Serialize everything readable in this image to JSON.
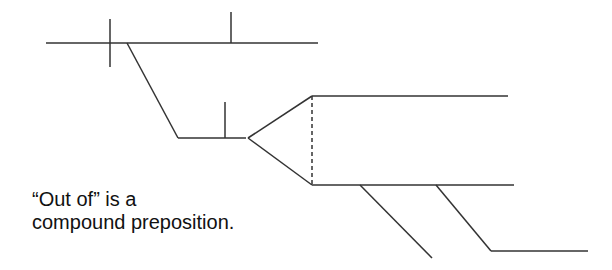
{
  "diagram": {
    "type": "sentence-diagram",
    "stroke_color": "#333333",
    "stroke_width": 1.5,
    "baseline": {
      "main_line": {
        "x1": 46,
        "y1": 43,
        "x2": 318,
        "y2": 43
      },
      "subject_predicate_divider": {
        "x1": 110,
        "y1": 19,
        "x2": 110,
        "y2": 67
      },
      "predicate_object_divider": {
        "x1": 231,
        "y1": 12,
        "x2": 231,
        "y2": 43
      }
    },
    "prepositional_phrase": {
      "diagonal": {
        "x1": 127,
        "y1": 43,
        "x2": 178,
        "y2": 138
      },
      "object_line": {
        "x1": 178,
        "y1": 138,
        "x2": 246,
        "y2": 138
      },
      "object_divider": {
        "x1": 225,
        "y1": 102,
        "x2": 225,
        "y2": 138
      }
    },
    "compound_fork": {
      "upper_branch": {
        "x1": 248,
        "y1": 138,
        "x2": 312,
        "y2": 96
      },
      "lower_branch": {
        "x1": 248,
        "y1": 138,
        "x2": 312,
        "y2": 185
      },
      "dashed_connector": {
        "x1": 312,
        "y1": 96,
        "x2": 312,
        "y2": 185
      },
      "upper_line": {
        "x1": 312,
        "y1": 96,
        "x2": 508,
        "y2": 96
      },
      "lower_line": {
        "x1": 312,
        "y1": 185,
        "x2": 514,
        "y2": 185
      }
    },
    "modifiers": [
      {
        "x1": 360,
        "y1": 185,
        "x2": 432,
        "y2": 258
      },
      {
        "x1": 436,
        "y1": 185,
        "x2": 491,
        "y2": 251
      }
    ],
    "modifier_object_line": {
      "x1": 491,
      "y1": 251,
      "x2": 588,
      "y2": 251
    }
  },
  "note": {
    "line1": "“Out of” is a",
    "line2": "compound preposition."
  }
}
